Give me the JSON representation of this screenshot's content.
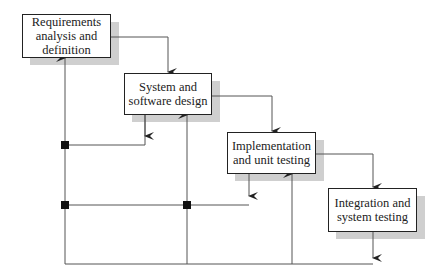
{
  "diagram": {
    "type": "waterfall-process-model",
    "stages": [
      {
        "id": "requirements",
        "label": "Requirements\nanalysis and\ndefinition"
      },
      {
        "id": "design",
        "label": "System and\nsoftware design"
      },
      {
        "id": "implementation",
        "label": "Implementation\nand unit testing"
      },
      {
        "id": "integration",
        "label": "Integration and\nsystem testing"
      }
    ],
    "colors": {
      "line": "#555555",
      "border": "#222222",
      "shadow": "#cfcfcf",
      "junction": "#111111"
    }
  }
}
